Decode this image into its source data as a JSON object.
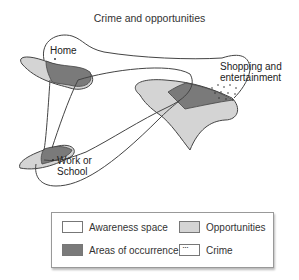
{
  "title": "Crime and opportunities",
  "nodes": {
    "home": "Home",
    "shopping": [
      "Shopping and",
      "entertainment"
    ],
    "work": [
      "Work or",
      "School"
    ]
  },
  "colors": {
    "awareness": "#ffffff",
    "opportunities": "#d4d4d4",
    "occurrence": "#7a7a7a",
    "outline": "#444444"
  },
  "legend": {
    "items": [
      {
        "label": "Awareness space",
        "swatch": "awareness"
      },
      {
        "label": "Opportunities",
        "swatch": "opportunities"
      },
      {
        "label": "Areas of occurrence",
        "swatch": "occurrence"
      },
      {
        "label": "Crime",
        "swatch": "crime"
      }
    ]
  }
}
